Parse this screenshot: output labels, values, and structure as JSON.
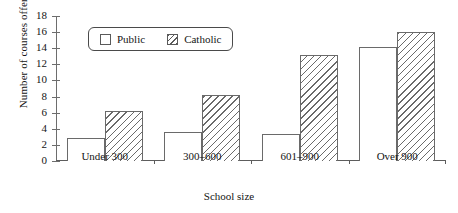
{
  "chart_data": {
    "type": "bar",
    "title": "",
    "xlabel": "School size",
    "ylabel": "Number of courses offered",
    "categories": [
      "Under 300",
      "300–600",
      "601–900",
      "Over 900"
    ],
    "series": [
      {
        "name": "Public",
        "values": [
          2.9,
          3.6,
          3.4,
          14.1
        ]
      },
      {
        "name": "Catholic",
        "values": [
          6.2,
          8.2,
          13.2,
          16.0
        ]
      }
    ],
    "ylim": [
      0,
      18
    ],
    "yticks": [
      0,
      2,
      4,
      6,
      8,
      10,
      12,
      14,
      16,
      18
    ],
    "grid": false,
    "legend_position": "top-left-inside",
    "legend_entries": [
      {
        "label": "Public",
        "swatch": "white-square"
      },
      {
        "label": "Catholic",
        "swatch": "hatched-square"
      }
    ]
  },
  "colors": {
    "axis": "#5d5d5d",
    "bar_outline": "#6a6a6a",
    "bar_fill": "#ffffff",
    "hatch": "#6a6a6a",
    "text": "#151515",
    "background": "#ffffff"
  }
}
